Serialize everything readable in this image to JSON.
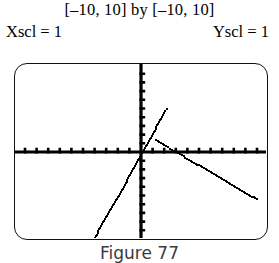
{
  "header": {
    "range_line": "[–10, 10] by [–10, 10]",
    "xscl_label": "Xscl = 1",
    "yscl_label": "Yscl = 1"
  },
  "caption": {
    "text": "Figure 77"
  },
  "colors": {
    "ink": "#000000",
    "border": "#111111",
    "background": "#ffffff",
    "caption": "#3b3b3b"
  },
  "chart_data": {
    "type": "line",
    "title": "",
    "xlabel": "",
    "ylabel": "",
    "xlim": [
      -10,
      10
    ],
    "ylim": [
      -10,
      10
    ],
    "xscl": 1,
    "yscl": 1,
    "grid": false,
    "legend": null,
    "axes": {
      "x_axis_visible": true,
      "y_axis_visible": true,
      "tick_marks": "every 1 unit on both axes",
      "x_ticks": [
        -10,
        -9,
        -8,
        -7,
        -6,
        -5,
        -4,
        -3,
        -2,
        -1,
        1,
        2,
        3,
        4,
        5,
        6,
        7,
        8,
        9,
        10
      ],
      "y_ticks": [
        -10,
        -9,
        -8,
        -7,
        -6,
        -5,
        -4,
        -3,
        -2,
        -1,
        1,
        2,
        3,
        4,
        5,
        6,
        7,
        8,
        9,
        10
      ]
    },
    "render_style": "pixelated dotted calculator trace",
    "series": [
      {
        "name": "steep ascending line",
        "style": "dotted",
        "slope": 2.4,
        "intercept": -0.35,
        "x_start": -4.4,
        "x_end": 2.2,
        "points": [
          [
            -4.4,
            -10.9
          ],
          [
            -4.0,
            -9.9
          ],
          [
            -3.5,
            -8.7
          ],
          [
            -3.0,
            -7.5
          ],
          [
            -2.5,
            -6.3
          ],
          [
            -2.0,
            -5.2
          ],
          [
            -1.5,
            -4.0
          ],
          [
            -1.0,
            -2.8
          ],
          [
            -0.5,
            -1.6
          ],
          [
            0.0,
            -0.35
          ],
          [
            0.5,
            0.85
          ],
          [
            1.0,
            2.05
          ],
          [
            1.5,
            3.25
          ],
          [
            2.0,
            4.45
          ],
          [
            2.2,
            4.95
          ]
        ]
      },
      {
        "name": "shallow descending line",
        "style": "dotted",
        "slope": -0.78,
        "intercept": 2.35,
        "x_start": 1.3,
        "x_end": 10.0,
        "points": [
          [
            1.3,
            1.34
          ],
          [
            2.0,
            0.79
          ],
          [
            2.5,
            0.4
          ],
          [
            3.0,
            0.01
          ],
          [
            3.5,
            -0.38
          ],
          [
            4.0,
            -0.77
          ],
          [
            5.0,
            -1.55
          ],
          [
            6.0,
            -2.33
          ],
          [
            7.0,
            -3.11
          ],
          [
            8.0,
            -3.89
          ],
          [
            9.0,
            -4.67
          ],
          [
            10.0,
            -5.45
          ]
        ]
      }
    ]
  }
}
